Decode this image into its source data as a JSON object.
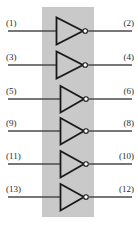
{
  "figure": {
    "width": 138,
    "height": 236,
    "background_color": "#ffffff"
  },
  "chip": {
    "name": "ic-body",
    "fill_color": "#c9c9c9",
    "x": 42,
    "y": 7,
    "width": 52,
    "height": 210
  },
  "style": {
    "wire_color": "#4a4a4a",
    "gate_color": "#1a1a1a",
    "bubble_fill": "#ffffff",
    "label_color": "#2b2b2b"
  },
  "gates": [
    {
      "name": "inverter-1",
      "symbol": "NOT",
      "row": 1,
      "cy": 31,
      "input_pin": "(1)",
      "output_pin": "(2)"
    },
    {
      "name": "inverter-2",
      "symbol": "NOT",
      "row": 2,
      "cy": 65,
      "input_pin": "(3)",
      "output_pin": "(4)"
    },
    {
      "name": "inverter-3",
      "symbol": "NOT",
      "row": 3,
      "cy": 99,
      "input_pin": "(5)",
      "output_pin": "(6)"
    },
    {
      "name": "inverter-4",
      "symbol": "NOT",
      "row": 4,
      "cy": 131,
      "input_pin": "(9)",
      "output_pin": "(8)"
    },
    {
      "name": "inverter-5",
      "symbol": "NOT",
      "row": 5,
      "cy": 164,
      "input_pin": "(11)",
      "output_pin": "(10)"
    },
    {
      "name": "inverter-6",
      "symbol": "NOT",
      "row": 6,
      "cy": 197,
      "input_pin": "(13)",
      "output_pin": "(12)"
    }
  ],
  "labels": {
    "left": [
      "(1)",
      "(3)",
      "(5)",
      "(9)",
      "(11)",
      "(13)"
    ],
    "right": [
      "(2)",
      "(4)",
      "(6)",
      "(8)",
      "(10)",
      "(12)"
    ]
  },
  "caption": {
    "text": "",
    "mark": ""
  }
}
